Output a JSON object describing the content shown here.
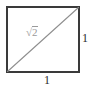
{
  "figure": {
    "kind": "geometry-diagram",
    "background_color": "#ffffff",
    "square": {
      "name": "unit-square",
      "stroke_color": "#3a3a3a",
      "stroke_width": 1.4,
      "fill": "none",
      "left": 7,
      "top": 7,
      "right": 79,
      "bottom": 72,
      "width": 72,
      "height": 65
    },
    "diagonal": {
      "name": "diagonal-line",
      "stroke_color": "#8f8f8f",
      "stroke_width": 1.1,
      "from": {
        "x": 7,
        "y": 72
      },
      "to": {
        "x": 79,
        "y": 7
      }
    },
    "labels": {
      "hypotenuse": {
        "radical_symbol": "√",
        "radicand": "2",
        "full_text": "√2",
        "color": "#9a9a9a",
        "font_size_px": 11
      },
      "right_side": {
        "text": "1",
        "color": "#2b2b2b",
        "font_size_px": 12
      },
      "bottom_side": {
        "text": "1",
        "color": "#2b2b2b",
        "font_size_px": 12
      }
    }
  }
}
